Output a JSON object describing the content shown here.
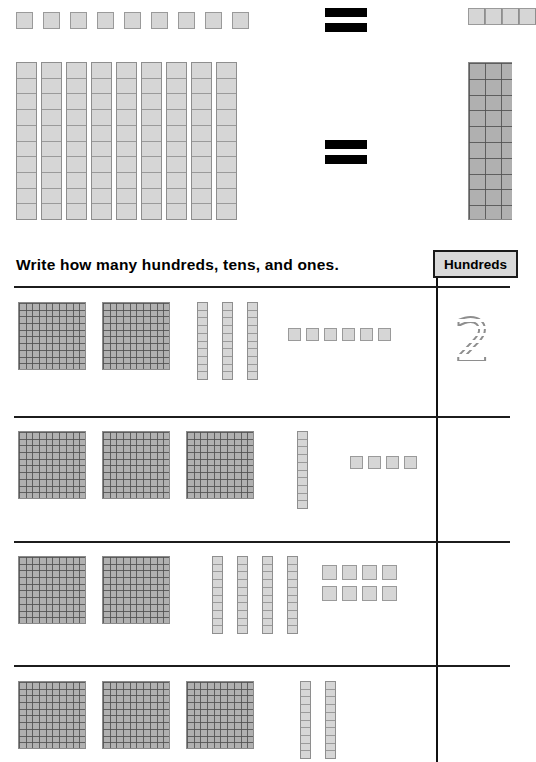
{
  "worksheet": {
    "instruction": "Write how many hundreds, tens, and ones.",
    "answer_column_header": "Hundreds"
  },
  "colors": {
    "flat_fill": "#b0b0b0",
    "rod_fill": "#d6d6d6",
    "cube_fill": "#d6d6d6",
    "grid_line": "#505050",
    "rule": "#1c1c1c",
    "header_fill": "#d9d9d9",
    "traced_digit": "#8e8e8e"
  },
  "demo": {
    "equation_1": {
      "left_label": "9 ones",
      "left_ones": 9,
      "operator": "=",
      "right_label": "partial strip of ones (cropped at page edge)",
      "right_cropped": true
    },
    "equation_2": {
      "left_label": "9 tens",
      "left_tens": 9,
      "operator": "=",
      "right_label": "hundred flat (cropped at page edge)",
      "right_cropped": true
    }
  },
  "rows": [
    {
      "index": 1,
      "hundreds": 2,
      "tens": 3,
      "ones": 6,
      "answer": "2",
      "answer_style": "traced"
    },
    {
      "index": 2,
      "hundreds": 3,
      "tens": 1,
      "ones": 4,
      "answer": "",
      "answer_style": "blank"
    },
    {
      "index": 3,
      "hundreds": 2,
      "tens": 4,
      "ones": 8,
      "answer": "",
      "answer_style": "blank"
    },
    {
      "index": 4,
      "hundreds": 3,
      "tens": 2,
      "ones": 0,
      "answer": "",
      "answer_style": "blank",
      "cropped_at_bottom": true
    }
  ]
}
